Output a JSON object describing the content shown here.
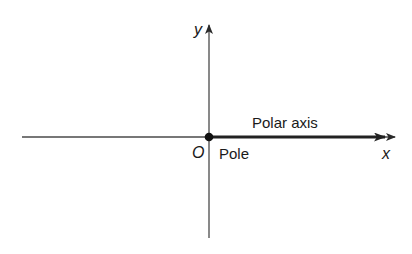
{
  "diagram": {
    "colors": {
      "background": "#ffffff",
      "axis": "#4a4a4a",
      "polar_axis": "#222222",
      "pole": "#111111",
      "text": "#1a1a1a"
    },
    "labels": {
      "y_axis": "y",
      "x_axis": "x",
      "origin": "O",
      "pole": "Pole",
      "polar_axis": "Polar axis"
    },
    "elements": [
      {
        "type": "axis",
        "name": "x-axis",
        "from": [
          22,
          137
        ],
        "to": [
          395,
          137
        ],
        "arrow": "end"
      },
      {
        "type": "axis",
        "name": "y-axis",
        "from": [
          209,
          238
        ],
        "to": [
          209,
          25
        ],
        "arrow": "end"
      },
      {
        "type": "ray",
        "name": "polar-axis",
        "from": [
          209,
          137
        ],
        "to": [
          385,
          137
        ],
        "arrow": "end",
        "weight": "bold"
      },
      {
        "type": "point",
        "name": "pole",
        "at": [
          209,
          137
        ]
      }
    ]
  }
}
